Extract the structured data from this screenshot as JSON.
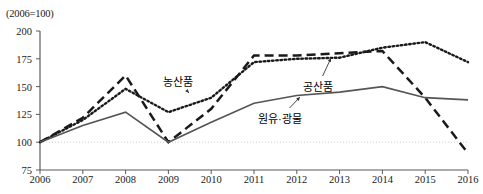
{
  "chart_data": {
    "type": "line",
    "title": "",
    "subtitle": "",
    "xlabel": "",
    "ylabel": "",
    "unit_note": "(2006=100)",
    "categories": [
      "2006",
      "2007",
      "2008",
      "2009",
      "2010",
      "2011",
      "2012",
      "2013",
      "2014",
      "2015",
      "2016"
    ],
    "x": [
      2006,
      2007,
      2008,
      2009,
      2010,
      2011,
      2012,
      2013,
      2014,
      2015,
      2016
    ],
    "ylim": [
      75,
      200
    ],
    "yticks": [
      75,
      100,
      125,
      150,
      175,
      200
    ],
    "ytick_labels": [
      "75",
      "100",
      "125",
      "150",
      "175",
      "200"
    ],
    "grid": false,
    "reference_line": {
      "value": 100,
      "style": "dotted",
      "color": "#cccccc"
    },
    "legend_position": "inline-annotations",
    "series": [
      {
        "name": "농산품",
        "style": "dotted",
        "color": "#1a1a1a",
        "values": [
          100,
          120,
          148,
          127,
          140,
          172,
          175,
          176,
          185,
          190,
          172
        ]
      },
      {
        "name": "공산품",
        "style": "dashed",
        "color": "#1a1a1a",
        "values": [
          100,
          122,
          160,
          100,
          130,
          178,
          178,
          180,
          182,
          140,
          90
        ]
      },
      {
        "name": "원유·광물",
        "style": "solid",
        "color": "#555555",
        "values": [
          100,
          115,
          127,
          100,
          118,
          135,
          142,
          145,
          150,
          140,
          138
        ]
      }
    ],
    "annotations": [
      {
        "text": "농산품",
        "x_px": 163,
        "y_px": 73,
        "arrow_to_x": 189,
        "arrow_to_y": 93
      },
      {
        "text": "공산품",
        "x_px": 303,
        "y_px": 78,
        "arrow_to_x": 331,
        "arrow_to_y": 58
      },
      {
        "text": "원유·광물",
        "x_px": 258,
        "y_px": 110,
        "arrow_to_x": 300,
        "arrow_to_y": 97
      }
    ]
  }
}
